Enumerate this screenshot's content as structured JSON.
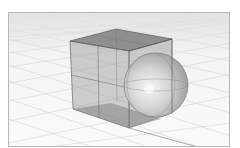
{
  "viewport": {
    "name": "Perspective",
    "background_color": "#f2f2f2",
    "grid_color": "#c8c8c8",
    "frame_color": "#b8b8b8"
  },
  "scene": {
    "objects": [
      {
        "type": "box",
        "name": "Cube",
        "color": "#8a8a8a",
        "opacity": 0.55
      },
      {
        "type": "sphere",
        "name": "Sphere",
        "color": "#c9c9c9"
      }
    ]
  }
}
